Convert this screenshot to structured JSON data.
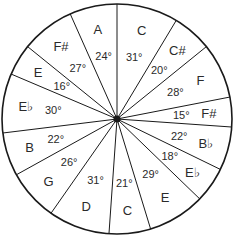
{
  "diagram": {
    "type": "pie-sectors",
    "center": [
      117,
      119
    ],
    "radius": 115,
    "start_angle_deg": 0,
    "direction": "clockwise",
    "line_color": "#1a1a1a",
    "background": "#ffffff",
    "sectors": [
      {
        "note": "C",
        "degrees": 31,
        "label": "31°"
      },
      {
        "note": "C#",
        "degrees": 20,
        "label": "20°"
      },
      {
        "note": "F",
        "degrees": 28,
        "label": "28°"
      },
      {
        "note": "F#",
        "degrees": 15,
        "label": "15°"
      },
      {
        "note": "B♭",
        "degrees": 22,
        "label": "22°"
      },
      {
        "note": "E♭",
        "degrees": 18,
        "label": "18°"
      },
      {
        "note": "E",
        "degrees": 29,
        "label": "29°"
      },
      {
        "note": "C",
        "degrees": 21,
        "label": "21°"
      },
      {
        "note": "D",
        "degrees": 31,
        "label": "31°"
      },
      {
        "note": "G",
        "degrees": 26,
        "label": "26°"
      },
      {
        "note": "B",
        "degrees": 22,
        "label": "22°"
      },
      {
        "note": "E♭",
        "degrees": 30,
        "label": "30°"
      },
      {
        "note": "E",
        "degrees": 16,
        "label": "16°"
      },
      {
        "note": "F#",
        "degrees": 27,
        "label": "27°"
      },
      {
        "note": "A",
        "degrees": 24,
        "label": "24°"
      }
    ]
  }
}
